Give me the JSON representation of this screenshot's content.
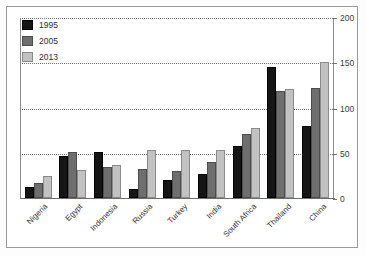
{
  "chart_data": {
    "type": "bar",
    "title": "",
    "xlabel": "",
    "ylabel": "",
    "ylim": [
      0,
      200
    ],
    "yticks": [
      0,
      50,
      100,
      150,
      200
    ],
    "ytick_labels": [
      "0",
      "50",
      "100",
      "150",
      "200"
    ],
    "grid": true,
    "grid_style": "dotted",
    "legend_position": "top-left",
    "categories": [
      "Nigeria",
      "Egypt",
      "Indonesia",
      "Russia",
      "Turkey",
      "India",
      "South Africa",
      "Thailand",
      "China"
    ],
    "series": [
      {
        "name": "1995",
        "color": "#151515",
        "values": [
          12,
          46,
          51,
          10,
          20,
          26,
          58,
          145,
          80
        ]
      },
      {
        "name": "2005",
        "color": "#6e6e6e",
        "values": [
          17,
          51,
          34,
          32,
          30,
          40,
          71,
          118,
          122
        ]
      },
      {
        "name": "2013",
        "color": "#c2c2c2",
        "values": [
          24,
          31,
          37,
          53,
          53,
          53,
          77,
          121,
          150
        ]
      }
    ]
  }
}
